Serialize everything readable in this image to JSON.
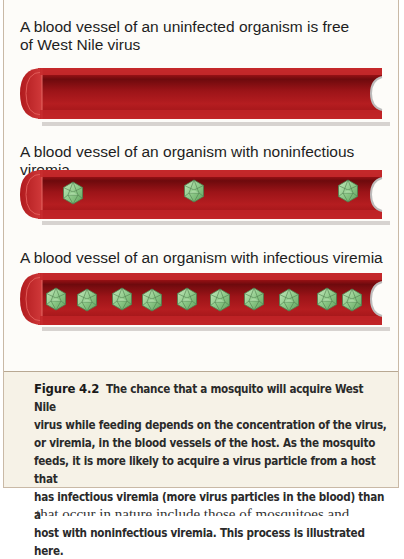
{
  "figure": {
    "panels": [
      {
        "label_line1": "A blood vessel of an uninfected organism is free",
        "label_line2": "of West Nile virus",
        "state": "uninfected",
        "virus_particle_count": 0
      },
      {
        "label_line1": "A blood vessel of an organism with noninfectious viremia",
        "state": "noninfectious viremia",
        "virus_particle_count": 3
      },
      {
        "label_line1": "A blood vessel of an organism with infectious viremia",
        "state": "infectious viremia",
        "virus_particle_count": 10
      }
    ],
    "colors": {
      "vessel_red": "#b3171b",
      "vessel_dark": "#7d0c10",
      "virus_green": "#8fca8a",
      "caption_bg": "#f6f2e7",
      "frame_border": "#c9b9a6"
    }
  },
  "caption": {
    "figure_number": "Figure 4.2",
    "lines": [
      "The chance that a mosquito will acquire West Nile",
      "virus while feeding depends on the concentration of the virus,",
      "or viremia, in the blood vessels of the host. As the mosquito",
      "feeds, it is more likely to acquire a virus particle from a host that",
      "has infectious viremia (more virus particles in the blood) than a",
      "host with noninfectious viremia. This process is illustrated here."
    ]
  },
  "body_text": {
    "cutoff_line": "that occur in nature include those of mosquitoes and"
  }
}
